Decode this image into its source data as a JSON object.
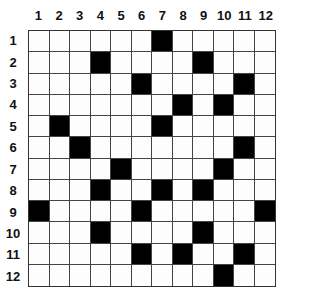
{
  "puzzle": {
    "columns": [
      "1",
      "2",
      "3",
      "4",
      "5",
      "6",
      "7",
      "8",
      "9",
      "10",
      "11",
      "12"
    ],
    "rows": [
      "1",
      "2",
      "3",
      "4",
      "5",
      "6",
      "7",
      "8",
      "9",
      "10",
      "11",
      "12"
    ],
    "size": 12,
    "black_cells": {
      "1": [
        7
      ],
      "2": [
        4,
        9
      ],
      "3": [
        6,
        11
      ],
      "4": [
        8,
        10
      ],
      "5": [
        2,
        7
      ],
      "6": [
        3,
        11
      ],
      "7": [
        5,
        10
      ],
      "8": [
        4,
        7,
        9
      ],
      "9": [
        1,
        6,
        12
      ],
      "10": [
        4,
        9
      ],
      "11": [
        6,
        8,
        11
      ],
      "12": [
        10
      ]
    },
    "colors": {
      "black_cell": "#000000",
      "white_cell": "#fdfdfd",
      "grid_line": "#444444"
    }
  }
}
